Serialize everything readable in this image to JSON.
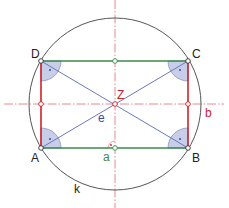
{
  "diagram": {
    "colors": {
      "circle": "#555555",
      "side_a": "#3a8a4a",
      "side_b": "#d0202a",
      "diagonal": "#6a78c0",
      "axis": "#e05060",
      "angle_fill": "#c8cde8",
      "angle_stroke": "#8a94c8",
      "label_black": "#222222",
      "label_red": "#d0202a",
      "label_green": "#3a8a4a",
      "label_blue": "#3a48a0"
    },
    "points": {
      "A": {
        "label": "A",
        "x": 41,
        "y": 148
      },
      "B": {
        "label": "B",
        "x": 188,
        "y": 148
      },
      "C": {
        "label": "C",
        "x": 188,
        "y": 61
      },
      "D": {
        "label": "D",
        "x": 41,
        "y": 61
      },
      "Z": {
        "label": "Z",
        "x": 115,
        "y": 104
      }
    },
    "labels": {
      "side_a": "a",
      "side_b": "b",
      "diagonal": "e",
      "circle": "k",
      "center": "Z",
      "corner_A": "A",
      "corner_B": "B",
      "corner_C": "C",
      "corner_D": "D"
    },
    "circle": {
      "cx": 115,
      "cy": 104,
      "r": 86
    },
    "right_angle_marks": [
      "A",
      "B",
      "C",
      "D",
      "axis-foot-a"
    ]
  }
}
